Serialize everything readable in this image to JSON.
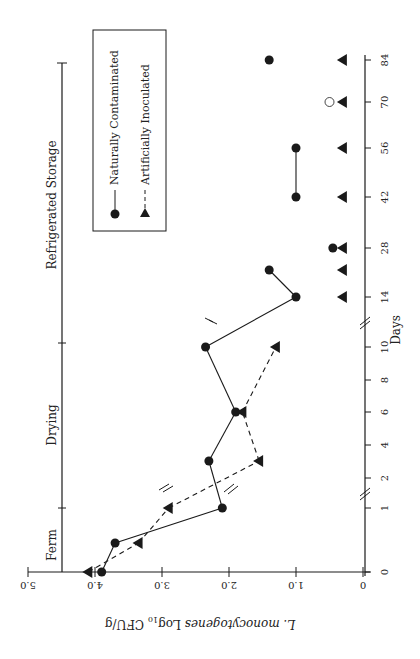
{
  "chart_data": {
    "type": "line",
    "orientation": "rotated 90deg clockwise (Days axis vertical on right, increasing upward; log axis horizontal at bottom, decreasing left-to-right as printed upside-down)",
    "title": "",
    "xlabel": "Days",
    "ylabel": "L. monocytogenes Log10 CFU/g",
    "ylabel_parts": {
      "italic": "L. monocytogenes",
      "plain": "Log",
      "sub": "10",
      "unit": "CFU/g"
    },
    "ylim": [
      0,
      5.0
    ],
    "y_ticks": [
      "0",
      "1.0",
      "2.0",
      "3.0",
      "4.0",
      "5.0"
    ],
    "x_ticks": [
      "0",
      "1",
      "2",
      "4",
      "6",
      "8",
      "10",
      "14",
      "28",
      "42",
      "56",
      "70",
      "84"
    ],
    "axis_breaks": [
      "between day 1 and 2",
      "between day 10 and 14"
    ],
    "phases": [
      {
        "label": "Ferm",
        "from_day": 0,
        "to_day": 1
      },
      {
        "label": "Drying",
        "from_day": 1,
        "to_day": 10
      },
      {
        "label": "Refrigerated Storage",
        "from_day": 10,
        "to_day": 84
      }
    ],
    "legend": {
      "position": "upper-left (rotated view)",
      "entries": [
        {
          "label": "Naturally Contaminated",
          "marker": "filled-circle",
          "line": "solid"
        },
        {
          "label": "Artificially Inoculated",
          "marker": "filled-triangle",
          "line": "dashed"
        }
      ]
    },
    "series": [
      {
        "name": "Naturally Contaminated",
        "marker": "circle",
        "line": "solid",
        "points": [
          {
            "day": 0,
            "value": 3.9
          },
          {
            "day": 0.5,
            "value": 3.7
          },
          {
            "day": 1,
            "value": 2.1
          },
          {
            "day": 3,
            "value": 2.3
          },
          {
            "day": 6,
            "value": 1.9
          },
          {
            "day": 10,
            "value": 2.35
          },
          {
            "day": 14,
            "value": 1.0
          },
          {
            "day": 21,
            "value": 1.4
          },
          {
            "day": 28,
            "value": 0.45,
            "connected": false
          },
          {
            "day": 42,
            "value": 1.0,
            "segment": "b"
          },
          {
            "day": 56,
            "value": 1.0,
            "segment": "b"
          },
          {
            "day": 70,
            "value": 0.5,
            "open": true,
            "connected": false
          },
          {
            "day": 84,
            "value": 1.4,
            "connected": false
          }
        ]
      },
      {
        "name": "Artificially Inoculated",
        "marker": "triangle",
        "line": "dashed",
        "points": [
          {
            "day": 0,
            "value": 4.1
          },
          {
            "day": 0.5,
            "value": 3.35
          },
          {
            "day": 1,
            "value": 2.9
          },
          {
            "day": 3.5,
            "value": 1.55
          },
          {
            "day": 6,
            "value": 1.8
          },
          {
            "day": 10,
            "value": 1.3
          },
          {
            "day": 14,
            "value": 0.3,
            "connected": false
          },
          {
            "day": 21,
            "value": 0.3,
            "connected": false
          },
          {
            "day": 28,
            "value": 0.3,
            "connected": false
          },
          {
            "day": 42,
            "value": 0.3,
            "connected": false
          },
          {
            "day": 56,
            "value": 0.3,
            "connected": false
          },
          {
            "day": 70,
            "value": 0.3,
            "connected": false
          },
          {
            "day": 84,
            "value": 0.3,
            "connected": false
          }
        ]
      }
    ]
  },
  "colors": {
    "ink": "#1a1a1a",
    "background": "#ffffff"
  }
}
